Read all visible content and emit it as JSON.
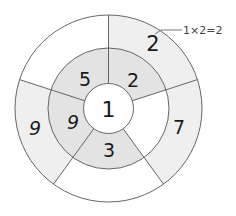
{
  "diagram": {
    "type": "concentric-number-wheel",
    "center": [
      108.5,
      108.5
    ],
    "radii": {
      "inner": 25,
      "middle": 60.5,
      "outer": 93.5
    },
    "spoke_angles_deg": [
      -90,
      -18,
      54,
      126,
      198
    ],
    "colors": {
      "stroke": "#555555",
      "inner_fill": "#dcdcdc",
      "middle_fill": "#e3e3e3",
      "outer_fill": "#efefef",
      "blank_fill": "#ffffff"
    },
    "center_value": "1",
    "middle_ring": [
      {
        "position": "top-right",
        "start": -90,
        "end": -18,
        "value": "2",
        "shaded": true,
        "label_xy": [
          133,
          80
        ]
      },
      {
        "position": "right",
        "start": -18,
        "end": 54,
        "value": "",
        "shaded": false,
        "label_xy": [
          145,
          120
        ]
      },
      {
        "position": "bottom",
        "start": 54,
        "end": 126,
        "value": "3",
        "shaded": true,
        "label_xy": [
          109,
          150
        ]
      },
      {
        "position": "left",
        "start": 126,
        "end": 198,
        "value": "9",
        "shaded": true,
        "label_xy": [
          73,
          122
        ]
      },
      {
        "position": "top-left",
        "start": 198,
        "end": 270,
        "value": "5",
        "shaded": true,
        "label_xy": [
          85,
          79
        ]
      }
    ],
    "outer_ring": [
      {
        "position": "top-right",
        "start": -90,
        "end": -18,
        "value": "2",
        "shaded": true,
        "label_xy": [
          153,
          44
        ]
      },
      {
        "position": "right",
        "start": -18,
        "end": 54,
        "value": "7",
        "shaded": true,
        "label_xy": [
          179,
          127
        ]
      },
      {
        "position": "bottom",
        "start": 54,
        "end": 126,
        "value": "",
        "shaded": false,
        "label_xy": [
          109,
          185
        ]
      },
      {
        "position": "left",
        "start": 126,
        "end": 198,
        "value": "9",
        "shaded": true,
        "label_xy": [
          35,
          128
        ]
      },
      {
        "position": "top-left",
        "start": 198,
        "end": 270,
        "value": "",
        "shaded": false,
        "label_xy": [
          62,
          45
        ]
      }
    ],
    "annotation": {
      "text": "1×2=2",
      "text_xy": [
        183,
        30
      ],
      "leader": [
        [
          155,
          34
        ],
        [
          161,
          30
        ],
        [
          182,
          30
        ]
      ]
    }
  }
}
